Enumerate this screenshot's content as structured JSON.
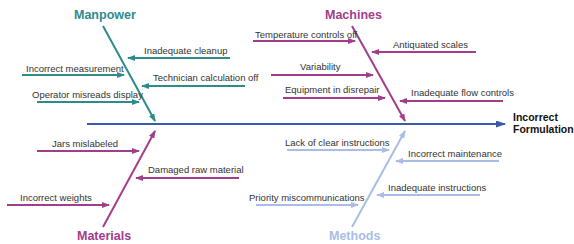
{
  "diagram": {
    "type": "fishbone",
    "effect": {
      "line1": "Incorrect",
      "line2": "Formulation"
    },
    "colors": {
      "manpower": "#2e8b8b",
      "machines": "#a23d8c",
      "materials": "#a23d8c",
      "methods": "#a9bde6",
      "spine": "#3a5aa8"
    },
    "categories": {
      "manpower": {
        "label": "Manpower",
        "causes": [
          "Inadequate cleanup",
          "Incorrect measurement",
          "Technician calculation off",
          "Operator misreads display"
        ]
      },
      "machines": {
        "label": "Machines",
        "causes": [
          "Temperature controls off",
          "Antiquated scales",
          "Variability",
          "Equipment in disrepair",
          "Inadequate flow controls"
        ]
      },
      "materials": {
        "label": "Materials",
        "causes": [
          "Jars mislabeled",
          "Damaged raw material",
          "Incorrect weights"
        ]
      },
      "methods": {
        "label": "Methods",
        "causes": [
          "Lack of clear instructions",
          "Incorrect maintenance",
          "Inadequate instructions",
          "Priority miscommunications"
        ]
      }
    }
  }
}
